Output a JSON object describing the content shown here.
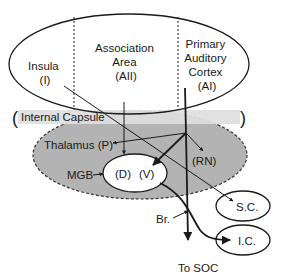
{
  "diagram": {
    "cortex": {
      "regions": [
        {
          "id": "insula",
          "lines": [
            "Insula",
            "(I)"
          ]
        },
        {
          "id": "association",
          "lines": [
            "Association",
            "Area",
            "(AII)"
          ]
        },
        {
          "id": "primary",
          "lines": [
            "Primary",
            "Auditory",
            "Cortex",
            "(AI)"
          ]
        }
      ]
    },
    "internal_capsule": {
      "label": "Internal Capsule",
      "open": "(",
      "close": ")"
    },
    "thalamus": {
      "label": "Thalamus (P)"
    },
    "mgb": {
      "label": "MGB",
      "dorsal": "(D)",
      "ventral": "(V)"
    },
    "rn": {
      "label": "(RN)"
    },
    "sc": {
      "label": "S.C."
    },
    "ic": {
      "label": "I.C."
    },
    "br": {
      "label": "Br."
    },
    "soc": {
      "label": "To SOC"
    },
    "colors": {
      "line": "#1a1a1a",
      "thalamus_fill": "#b3b3b3",
      "capsule_fill": "#dedede",
      "background": "#ffffff"
    }
  }
}
